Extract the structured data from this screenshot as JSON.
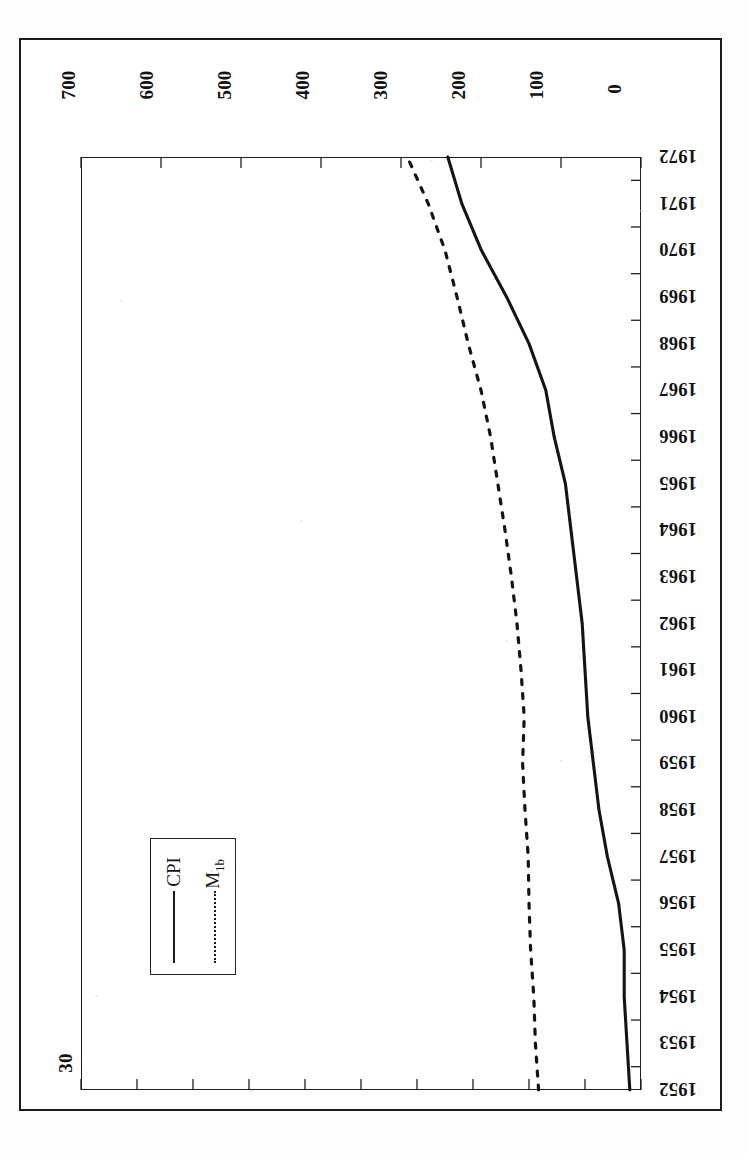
{
  "figure": {
    "orientation": "rotated-90-clockwise",
    "background_color": "#ffffff",
    "ink_color": "#1a1a1a"
  },
  "legend": {
    "title": "",
    "position": "lower-left",
    "entries": [
      {
        "label": "CPI",
        "label_main": "CPI",
        "label_sub": "",
        "style": "solid"
      },
      {
        "label": "M1b",
        "label_main": "M",
        "label_sub": "1b",
        "style": "dotted"
      }
    ]
  },
  "chart_data": {
    "type": "line",
    "title": "",
    "subtitle": "",
    "xlabel": "",
    "ylabel": "",
    "grid": false,
    "legend_position": "lower-left",
    "axes": {
      "category_axis": {
        "name": "Year",
        "orientation": "vertical-on-page (right side), descending top to bottom",
        "ticks": [
          1972,
          1971,
          1970,
          1969,
          1968,
          1967,
          1966,
          1965,
          1964,
          1963,
          1962,
          1961,
          1960,
          1959,
          1958,
          1957,
          1956,
          1955,
          1954,
          1953,
          1952
        ]
      },
      "top_axis": {
        "name": "M1b",
        "series": "M1b",
        "position": "top-of-page",
        "tick_labels": [
          "700",
          "600",
          "500",
          "400",
          "300",
          "200",
          "100",
          "0"
        ],
        "ticks": [
          700,
          600,
          500,
          400,
          300,
          200,
          100,
          0
        ],
        "range": [
          0,
          700
        ],
        "direction": "decreasing-left-to-right"
      },
      "bottom_axis": {
        "name": "CPI",
        "series": "CPI",
        "position": "bottom-of-page",
        "tick_labels": [
          "30",
          "28",
          "26",
          "24",
          "22",
          "20",
          "18",
          "16",
          "14",
          "12",
          "10"
        ],
        "ticks": [
          30,
          28,
          26,
          24,
          22,
          20,
          18,
          16,
          14,
          12,
          10
        ],
        "range": [
          10,
          30
        ],
        "direction": "decreasing-left-to-right"
      }
    },
    "categories": [
      1952,
      1953,
      1954,
      1955,
      1956,
      1957,
      1958,
      1959,
      1960,
      1961,
      1962,
      1963,
      1964,
      1965,
      1966,
      1967,
      1968,
      1969,
      1970,
      1971,
      1972
    ],
    "series": [
      {
        "name": "CPI",
        "style": "solid",
        "axis": "bottom",
        "axis_range": [
          10,
          30
        ],
        "values": [
          10.4,
          10.5,
          10.6,
          10.6,
          10.8,
          11.2,
          11.5,
          11.7,
          11.9,
          12.0,
          12.1,
          12.3,
          12.5,
          12.7,
          13.1,
          13.4,
          14.0,
          14.8,
          15.7,
          16.4,
          16.9
        ]
      },
      {
        "name": "M1b",
        "style": "dotted",
        "axis": "top",
        "axis_range": [
          0,
          700
        ],
        "values": [
          128,
          132,
          134,
          138,
          140,
          141,
          145,
          148,
          146,
          150,
          155,
          162,
          170,
          179,
          188,
          200,
          216,
          230,
          245,
          266,
          292
        ]
      }
    ]
  }
}
